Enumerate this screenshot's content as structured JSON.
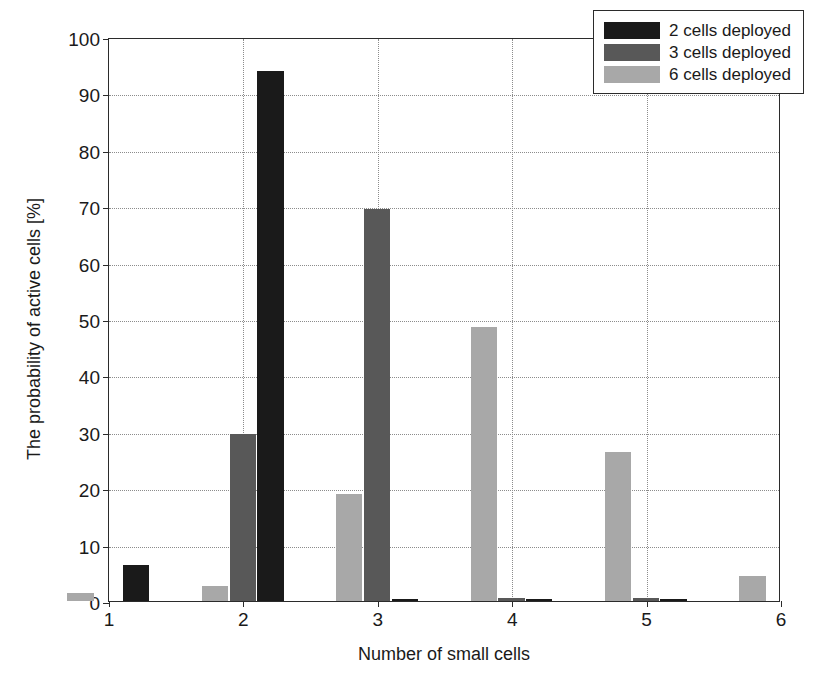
{
  "chart_data": {
    "type": "bar",
    "title": "",
    "xlabel": "Number of small cells",
    "ylabel": "The probability of active cells [%]",
    "xlim": [
      1,
      6
    ],
    "ylim": [
      0,
      100
    ],
    "xticks": [
      "1",
      "2",
      "3",
      "4",
      "5",
      "6"
    ],
    "yticks": [
      "0",
      "10",
      "20",
      "30",
      "40",
      "50",
      "60",
      "70",
      "80",
      "90",
      "100"
    ],
    "grid": "dotted-both-axes",
    "legend_position": "top-right",
    "categories": [
      1,
      2,
      3,
      4,
      5,
      6
    ],
    "series": [
      {
        "name": "2 cells deployed",
        "color": "#1a1a1a",
        "values": [
          6.4,
          94.0,
          0.4,
          0.3,
          0.3,
          0.0
        ]
      },
      {
        "name": "3 cells deployed",
        "color": "#585858",
        "values": [
          0.0,
          29.7,
          69.5,
          0.5,
          0.5,
          0.0
        ]
      },
      {
        "name": "6 cells deployed",
        "color": "#a8a8a8",
        "values": [
          1.4,
          2.7,
          19.0,
          48.5,
          26.5,
          4.5
        ]
      }
    ]
  },
  "legend": {
    "items": [
      {
        "label": "2 cells deployed",
        "color": "#1a1a1a"
      },
      {
        "label": "3 cells deployed",
        "color": "#585858"
      },
      {
        "label": "6 cells deployed",
        "color": "#a8a8a8"
      }
    ]
  },
  "colors": {
    "axis": "#2b2b2b",
    "grid": "#8c8c8c",
    "background": "#ffffff",
    "text": "#1a1a1a"
  }
}
